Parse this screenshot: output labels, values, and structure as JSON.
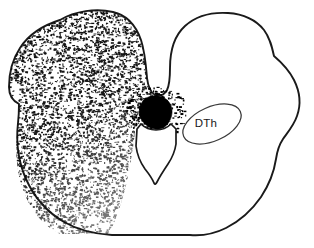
{
  "figure": {
    "type": "neuroanatomical-cross-section-line-drawing",
    "background_color": "#ffffff",
    "ink_color": "#1a1a1a",
    "width": 314,
    "height": 248,
    "labels": [
      {
        "id": "dth",
        "text": "DTh",
        "x": 206,
        "y": 127,
        "name": "dorsal-thalamus-label"
      }
    ],
    "regions": {
      "stippled_field": {
        "name": "stippled-label-field",
        "description": "dense stipple covering left hemisphere, densest dorsolaterally, fading ventromedially",
        "fill_color": "#0d0d0d"
      },
      "lesion": {
        "name": "solid-black-lesion-blob",
        "description": "solid black mass at dorsomedial border of third ventricle",
        "fill_color": "#000000",
        "bounds": [
          138,
          97,
          172,
          130
        ]
      },
      "ventricle": {
        "name": "third-ventricle-outline",
        "description": "shield shaped outline tapering to a ventral point",
        "fill_color": "#ffffff"
      },
      "dth_nucleus": {
        "name": "dorsal-thalamus-ellipse",
        "description": "tilted ellipse enclosing the DTh label",
        "stroke_color": "#3a3a3a"
      }
    }
  }
}
